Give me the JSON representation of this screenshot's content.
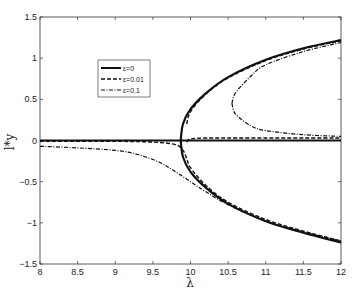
{
  "chart_data": {
    "type": "line",
    "title": "",
    "xlabel": "λ",
    "ylabel": "l*y",
    "xlim": [
      8,
      12
    ],
    "ylim": [
      -1.5,
      1.5
    ],
    "xticks": [
      8,
      8.5,
      9,
      9.5,
      10,
      10.5,
      11,
      11.5,
      12
    ],
    "xtick_labels": [
      "8",
      "8.5",
      "9",
      "9.5",
      "10",
      "10.5",
      "11",
      "11.5",
      "12"
    ],
    "yticks": [
      -1.5,
      -1,
      -0.5,
      0,
      0.5,
      1,
      1.5
    ],
    "ytick_labels": [
      "-1.5",
      "-1",
      "-0.5",
      "0",
      "0.5",
      "1",
      "1.5"
    ],
    "grid": false,
    "legend_position": "upper-left-inside",
    "series": [
      {
        "name": "ε=0",
        "style": "solid",
        "width": 2.2,
        "branches": [
          {
            "x": [
              8,
              12
            ],
            "y": [
              0,
              0
            ]
          },
          {
            "x": [
              9.87,
              9.9,
              10,
              10.2,
              10.5,
              11,
              11.5,
              12
            ],
            "y": [
              0,
              0.2,
              0.38,
              0.57,
              0.77,
              0.98,
              1.12,
              1.22
            ]
          },
          {
            "x": [
              9.87,
              9.9,
              10,
              10.2,
              10.5,
              11,
              11.5,
              12
            ],
            "y": [
              0,
              -0.2,
              -0.38,
              -0.57,
              -0.77,
              -0.98,
              -1.12,
              -1.24
            ]
          }
        ]
      },
      {
        "name": "ε=0.01",
        "style": "dashed",
        "width": 1.4,
        "branches": [
          {
            "x": [
              8,
              9,
              9.5,
              9.8,
              9.9,
              9.95,
              10,
              10.2,
              10.5,
              11,
              11.5,
              12
            ],
            "y": [
              -0.01,
              -0.01,
              -0.02,
              -0.05,
              -0.12,
              -0.22,
              -0.33,
              -0.54,
              -0.75,
              -0.96,
              -1.1,
              -1.22
            ]
          },
          {
            "x": [
              9.95,
              10,
              10.2,
              10.5,
              11,
              11.5,
              12
            ],
            "y": [
              -0.02,
              0.02,
              0.03,
              0.03,
              0.03,
              0.03,
              0.03
            ]
          },
          {
            "x": [
              9.95,
              10,
              10.2,
              10.5,
              11,
              11.5,
              12
            ],
            "y": [
              0.2,
              0.35,
              0.56,
              0.76,
              0.97,
              1.11,
              1.21
            ]
          }
        ]
      },
      {
        "name": "ε=0.1",
        "style": "dashdot",
        "width": 1.2,
        "branches": [
          {
            "x": [
              8,
              8.5,
              9,
              9.3,
              9.6,
              9.8,
              10,
              10.2,
              10.5,
              11,
              11.5,
              12
            ],
            "y": [
              -0.07,
              -0.09,
              -0.12,
              -0.17,
              -0.27,
              -0.38,
              -0.5,
              -0.62,
              -0.78,
              -0.98,
              -1.11,
              -1.22
            ]
          },
          {
            "x": [
              10.55,
              10.6,
              10.8,
              11,
              11.5,
              12
            ],
            "y": [
              0.45,
              0.32,
              0.18,
              0.12,
              0.07,
              0.05
            ]
          },
          {
            "x": [
              10.55,
              10.6,
              10.8,
              11,
              11.5,
              12
            ],
            "y": [
              0.45,
              0.58,
              0.78,
              0.92,
              1.08,
              1.19
            ]
          }
        ]
      }
    ],
    "legend": [
      {
        "label": "ε=0",
        "style": "solid"
      },
      {
        "label": "ε=0.01",
        "style": "dashed"
      },
      {
        "label": "ε=0.1",
        "style": "dashdot"
      }
    ]
  },
  "colors": {
    "line": "#111111",
    "axis": "#333333",
    "background": "#ffffff"
  }
}
